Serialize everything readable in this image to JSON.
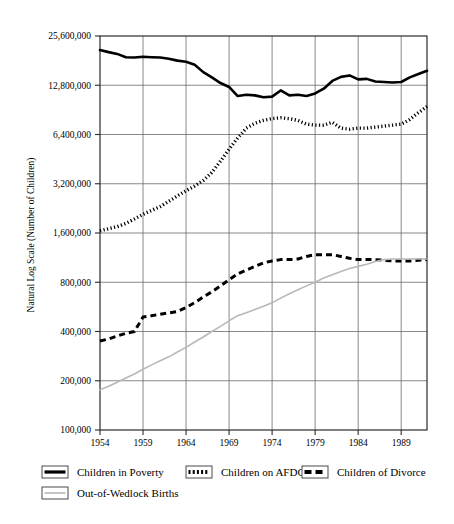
{
  "chart_data": {
    "type": "line",
    "title": "",
    "xlabel": "",
    "ylabel": "Natural Log Scale (Number of Children)",
    "scale": "log2",
    "grid": true,
    "legend_position": "bottom",
    "xlim": [
      1954,
      1992
    ],
    "ylim": [
      100000,
      25600000
    ],
    "ytick_labels": [
      "25,600,000",
      "12,800,000",
      "6,400,000",
      "3,200,000",
      "1,600,000",
      "800,000",
      "400,000",
      "200,000",
      "100,000"
    ],
    "ytick_values": [
      25600000,
      12800000,
      6400000,
      3200000,
      1600000,
      800000,
      400000,
      200000,
      100000
    ],
    "xtick_labels": [
      "1954",
      "1959",
      "1964",
      "1969",
      "1974",
      "1979",
      "1984",
      "1989"
    ],
    "xtick_values": [
      1954,
      1959,
      1964,
      1969,
      1974,
      1979,
      1984,
      1989
    ],
    "x": [
      1954,
      1955,
      1956,
      1957,
      1958,
      1959,
      1960,
      1961,
      1962,
      1963,
      1964,
      1965,
      1966,
      1967,
      1968,
      1969,
      1970,
      1971,
      1972,
      1973,
      1974,
      1975,
      1976,
      1977,
      1978,
      1979,
      1980,
      1981,
      1982,
      1983,
      1984,
      1985,
      1986,
      1987,
      1988,
      1989,
      1990,
      1991,
      1992
    ],
    "series": [
      {
        "name": "Children in Poverty",
        "style": "solid",
        "color": "#000000",
        "values": [
          21000000,
          20400000,
          19900000,
          19000000,
          18900000,
          19100000,
          19000000,
          18900000,
          18600000,
          18100000,
          17800000,
          17100000,
          15400000,
          14300000,
          13200000,
          12500000,
          11000000,
          11200000,
          11100000,
          10800000,
          10900000,
          11900000,
          11100000,
          11200000,
          11000000,
          11400000,
          12200000,
          13600000,
          14400000,
          14700000,
          13900000,
          14000000,
          13500000,
          13400000,
          13300000,
          13400000,
          14300000,
          15000000,
          15700000
        ]
      },
      {
        "name": "Children on AFDC",
        "style": "dotted",
        "color": "#000000",
        "values": [
          1650000,
          1700000,
          1750000,
          1830000,
          1950000,
          2080000,
          2200000,
          2320000,
          2500000,
          2700000,
          2900000,
          3100000,
          3350000,
          3750000,
          4400000,
          5200000,
          6100000,
          7000000,
          7500000,
          7800000,
          8000000,
          8100000,
          8000000,
          7800000,
          7400000,
          7300000,
          7300000,
          7600000,
          7000000,
          6900000,
          7000000,
          7000000,
          7100000,
          7200000,
          7300000,
          7400000,
          7900000,
          8700000,
          9500000
        ]
      },
      {
        "name": "Children of Divorce",
        "style": "dashed",
        "color": "#000000",
        "values": [
          350000,
          360000,
          375000,
          390000,
          400000,
          490000,
          500000,
          510000,
          520000,
          530000,
          560000,
          600000,
          650000,
          700000,
          760000,
          830000,
          900000,
          950000,
          1000000,
          1050000,
          1080000,
          1100000,
          1100000,
          1110000,
          1150000,
          1180000,
          1180000,
          1180000,
          1150000,
          1120000,
          1100000,
          1100000,
          1100000,
          1090000,
          1080000,
          1080000,
          1080000,
          1090000,
          1100000
        ]
      },
      {
        "name": "Out-of-Wedlock Births",
        "style": "solid-light",
        "color": "#b8b8b8",
        "values": [
          176000,
          185000,
          196000,
          208000,
          220000,
          235000,
          250000,
          265000,
          280000,
          300000,
          320000,
          345000,
          370000,
          400000,
          430000,
          465000,
          500000,
          520000,
          545000,
          570000,
          600000,
          640000,
          680000,
          720000,
          760000,
          800000,
          850000,
          890000,
          930000,
          970000,
          1000000,
          1030000,
          1070000,
          1100000,
          1110000,
          1110000,
          1110000,
          1110000,
          1110000
        ]
      }
    ]
  },
  "legend": {
    "items": [
      {
        "label": "Children in Poverty",
        "style": "solid"
      },
      {
        "label": "Children on AFDC",
        "style": "dotted"
      },
      {
        "label": "Children of Divorce",
        "style": "dashed"
      },
      {
        "label": "Out-of-Wedlock Births",
        "style": "solid-light"
      }
    ]
  }
}
